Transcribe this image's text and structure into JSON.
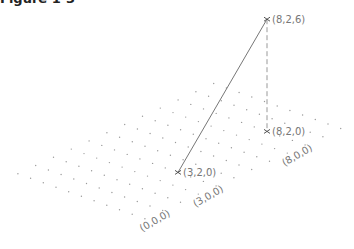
{
  "caption": "Figure 1-3",
  "diagram": {
    "type": "isometric-3d-grid",
    "grid": {
      "x_range": [
        0,
        9
      ],
      "y_range": [
        0,
        5
      ],
      "dot_color": "#9a9a9a"
    },
    "projection": {
      "origin_px": [
        150,
        206
      ],
      "x_unit_px": [
        17.8,
        -8.2
      ],
      "y_unit_px": [
        -12.7,
        -4.5
      ],
      "z_unit_px": [
        0,
        -18.7
      ]
    },
    "points": [
      {
        "coord": [
          3,
          2,
          0
        ],
        "label": "(3,2,0)"
      },
      {
        "coord": [
          8,
          2,
          0
        ],
        "label": "(8,2,0)"
      },
      {
        "coord": [
          8,
          2,
          6
        ],
        "label": "(8,2,6)"
      }
    ],
    "segments": [
      {
        "from": [
          3,
          2,
          0
        ],
        "to": [
          8,
          2,
          6
        ],
        "style": "solid",
        "color": "#777777"
      },
      {
        "from": [
          8,
          2,
          6
        ],
        "to": [
          8,
          2,
          0
        ],
        "style": "dashed",
        "color": "#999999"
      }
    ],
    "axis_labels": [
      {
        "coord": [
          0,
          0,
          0
        ],
        "label": "(0,0,0)"
      },
      {
        "coord": [
          3,
          0,
          0
        ],
        "label": "(3,0,0)"
      },
      {
        "coord": [
          8,
          0,
          0
        ],
        "label": "(8,0,0)"
      }
    ]
  }
}
